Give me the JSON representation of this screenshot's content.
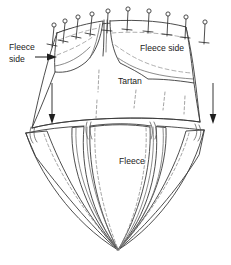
{
  "figure": {
    "title": "Tartan and fleece joining diagram",
    "type": "sewing-construction-diagram",
    "canvas": {
      "width": 231,
      "height": 265,
      "background": "#ffffff"
    },
    "ink": {
      "outline": "#3a3a3a",
      "soft_outline": "#6d6d6d",
      "dashed_stitch": "#8c8c8c",
      "pin": "#2e2e2e",
      "arrow": "#1f1f1f",
      "text": "#1a1a1a"
    }
  },
  "labels": {
    "fleece_side_left_line1": "Fleece",
    "fleece_side_left_line2": "side",
    "fleece_side_right": "Fleece side",
    "tartan": "Tartan",
    "fleece_bottom": "Fleece"
  },
  "annotations": {
    "leader_arrow_label": "points to left fleece flap",
    "down_arrow_left_label": "fold down left",
    "down_arrow_right_label": "fold down right"
  },
  "pins": {
    "left_flap_count": 4,
    "right_flap_count": 6,
    "total": 10,
    "style": "straight-pin-with-round-head"
  },
  "panels": {
    "upper": "tartan yoke with two pinned fleece facings",
    "lower": "fleece gored skirt with four panels and stitch lines"
  }
}
